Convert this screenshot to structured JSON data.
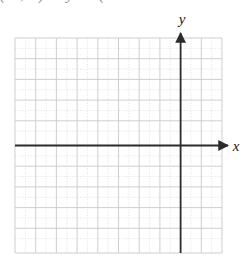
{
  "figure": {
    "name": "blank-cartesian-coordinate-grid",
    "type": "coordinate-grid",
    "background_color": "#ffffff",
    "clipped_header_text": "(    ,    )      y       (",
    "axis_labels": {
      "x": "x",
      "y": "y"
    },
    "colors": {
      "grid_line": "#c9c9c9",
      "grid_dotted_line": "#dcdcdc",
      "axis_line": "#2b2b2b",
      "label_text": "#1a1a1a",
      "clipped_text": "#8d8d8d"
    },
    "grid": {
      "columns": 10,
      "rows": 10,
      "cell_size_px": 20.7,
      "left_px": 15,
      "top_px": 38,
      "right_px": 222,
      "bottom_px": 253,
      "dotted_subdivisions": true
    },
    "axes": {
      "x_axis": {
        "row_index_from_top": 5,
        "y_px": 145.5,
        "start_px": 15,
        "end_px": 232,
        "arrowhead": "right",
        "label_x_px": 238,
        "label_y_px": 151
      },
      "y_axis": {
        "column_index_from_left": 8,
        "x_px": 180.6,
        "start_px": 253,
        "end_px": 28,
        "arrowhead": "up",
        "label_x_px": 182,
        "label_y_px": 24
      }
    }
  }
}
